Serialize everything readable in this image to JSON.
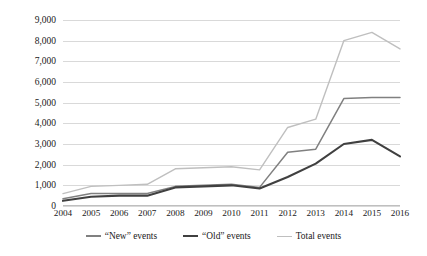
{
  "chart_data": {
    "type": "line",
    "title": "",
    "xlabel": "",
    "ylabel": "",
    "grid": true,
    "legend_position": "bottom",
    "ylim": [
      0,
      9000
    ],
    "ytick_step": 1000,
    "ytick_labels": [
      "9,000",
      "8,000",
      "7,000",
      "6,000",
      "5,000",
      "4,000",
      "3,000",
      "2,000",
      "1,000",
      "0"
    ],
    "ytick_values": [
      9000,
      8000,
      7000,
      6000,
      5000,
      4000,
      3000,
      2000,
      1000,
      0
    ],
    "categories": [
      "2004",
      "2005",
      "2006",
      "2007",
      "2008",
      "2009",
      "2010",
      "2011",
      "2012",
      "2013",
      "2014",
      "2015",
      "2016"
    ],
    "x": [
      2004,
      2005,
      2006,
      2007,
      2008,
      2009,
      2010,
      2011,
      2012,
      2013,
      2014,
      2015,
      2016
    ],
    "series": [
      {
        "name": "“New” events",
        "color": "#808080",
        "values": [
          350,
          600,
          600,
          600,
          950,
          1000,
          1050,
          900,
          2600,
          2750,
          5200,
          5250,
          5250
        ]
      },
      {
        "name": "“Old” events",
        "color": "#404040",
        "values": [
          250,
          450,
          500,
          500,
          900,
          950,
          1000,
          850,
          1400,
          2050,
          3000,
          3200,
          2400
        ]
      },
      {
        "name": "Total events",
        "color": "#bfbfbf",
        "values": [
          600,
          950,
          1000,
          1050,
          1800,
          1850,
          1900,
          1750,
          3800,
          4200,
          8000,
          8400,
          7600
        ]
      }
    ]
  },
  "legend": {
    "items": [
      {
        "label": "“New” events",
        "swatch": "line-swatch-new"
      },
      {
        "label": "“Old” events",
        "swatch": "line-swatch-old"
      },
      {
        "label": "Total events",
        "swatch": "line-swatch-total"
      }
    ]
  }
}
